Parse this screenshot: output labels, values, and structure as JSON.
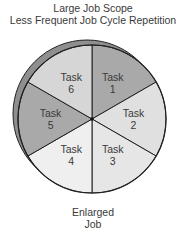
{
  "title": {
    "line1": "Large Job Scope",
    "line2": "Less Frequent Job Cycle Repetition"
  },
  "diagram": {
    "type": "pie-wheel",
    "center": [
      92,
      119
    ],
    "radius": 74,
    "rim_offset": [
      -5,
      -5
    ],
    "colors": {
      "dark": "#a9a9a9",
      "medium": "#c9c9c9",
      "light": "#e2e2e2",
      "lighter": "#ececec",
      "rim": "#8f8f8f",
      "stroke": "#222222"
    },
    "segments": [
      {
        "id": 1,
        "label": "Task",
        "number": "1",
        "shade": "#a9a9a9"
      },
      {
        "id": 2,
        "label": "Task",
        "number": "2",
        "shade": "#e0e0e0"
      },
      {
        "id": 3,
        "label": "Task",
        "number": "3",
        "shade": "#e6e6e6"
      },
      {
        "id": 4,
        "label": "Task",
        "number": "4",
        "shade": "#efefef"
      },
      {
        "id": 5,
        "label": "Task",
        "number": "5",
        "shade": "#a9a9a9"
      },
      {
        "id": 6,
        "label": "Task",
        "number": "6",
        "shade": "#d6d6d6"
      }
    ]
  },
  "caption": {
    "line1": "Enlarged",
    "line2": "Job"
  }
}
